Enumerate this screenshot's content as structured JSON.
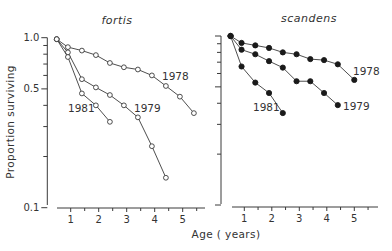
{
  "chart_data": [
    {
      "type": "line",
      "title": "fortis",
      "xlabel": "Age ( years)",
      "ylabel": "Proportion surviving",
      "yscale": "log",
      "ylim": [
        0.1,
        1.0
      ],
      "xlim": [
        0.5,
        5.5
      ],
      "yticks": [
        {
          "value": 1.0,
          "label": "1.0"
        },
        {
          "value": 0.5,
          "label": "0.5"
        },
        {
          "value": 0.1,
          "label": "0.1"
        }
      ],
      "yminor_ticks": [
        0.9,
        0.8,
        0.7,
        0.6,
        0.4,
        0.3,
        0.2
      ],
      "xticks": [
        1,
        2,
        3,
        4,
        5
      ],
      "xminor_ticks": [
        1.5,
        2.5,
        3.5,
        4.5,
        5.5
      ],
      "marker": "open-circle",
      "grid": false,
      "series": [
        {
          "name": "1978",
          "x": [
            0.5,
            0.9,
            1.4,
            1.9,
            2.4,
            2.9,
            3.4,
            3.9,
            4.4,
            4.9,
            5.4
          ],
          "values": [
            0.98,
            0.88,
            0.84,
            0.79,
            0.71,
            0.67,
            0.65,
            0.6,
            0.52,
            0.45,
            0.36
          ],
          "label_pos": [
            162,
            80
          ]
        },
        {
          "name": "1979",
          "x": [
            0.5,
            0.9,
            1.4,
            1.9,
            2.4,
            2.9,
            3.4,
            3.9,
            4.4
          ],
          "values": [
            0.98,
            0.82,
            0.57,
            0.51,
            0.46,
            0.4,
            0.34,
            0.23,
            0.15
          ],
          "label_pos": [
            134,
            112
          ]
        },
        {
          "name": "1981",
          "x": [
            0.5,
            0.9,
            1.4,
            1.9,
            2.4
          ],
          "values": [
            0.98,
            0.77,
            0.47,
            0.4,
            0.32
          ],
          "label_pos": [
            68,
            112
          ]
        }
      ]
    },
    {
      "type": "line",
      "title": "scandens",
      "xlabel": "Age ( years)",
      "ylabel": "",
      "yscale": "log",
      "ylim": [
        0.1,
        1.0
      ],
      "xlim": [
        0.5,
        5.5
      ],
      "yticks": [
        {
          "value": 1.0,
          "label": ""
        },
        {
          "value": 0.5,
          "label": ""
        },
        {
          "value": 0.1,
          "label": ""
        }
      ],
      "yminor_ticks": [
        0.9,
        0.8,
        0.7,
        0.6,
        0.4,
        0.3,
        0.2
      ],
      "xticks": [
        1,
        2,
        3,
        4,
        5
      ],
      "xminor_ticks": [
        1.5,
        2.5,
        3.5,
        4.5,
        5.5
      ],
      "marker": "filled-circle",
      "grid": false,
      "series": [
        {
          "name": "1978",
          "x": [
            0.5,
            0.9,
            1.4,
            1.9,
            2.4,
            2.9,
            3.4,
            3.9,
            4.4,
            5.0
          ],
          "values": [
            1.0,
            0.91,
            0.88,
            0.85,
            0.8,
            0.78,
            0.73,
            0.72,
            0.68,
            0.55
          ],
          "label_pos": [
            353,
            75
          ]
        },
        {
          "name": "1979",
          "x": [
            0.5,
            0.9,
            1.4,
            1.9,
            2.4,
            2.9,
            3.4,
            3.9,
            4.4
          ],
          "values": [
            1.0,
            0.83,
            0.78,
            0.71,
            0.65,
            0.54,
            0.54,
            0.46,
            0.39
          ],
          "label_pos": [
            343,
            110
          ]
        },
        {
          "name": "1981",
          "x": [
            0.5,
            0.9,
            1.4,
            1.9,
            2.4
          ],
          "values": [
            1.0,
            0.66,
            0.53,
            0.46,
            0.35
          ],
          "label_pos": [
            253,
            111
          ]
        }
      ]
    }
  ],
  "figure": {
    "ylabel": "Proportion surviving",
    "xlabel": "Age ( years)",
    "panels": [
      {
        "title": "fortis",
        "title_x": 117,
        "title_y": 24
      },
      {
        "title": "scandens",
        "title_x": 309,
        "title_y": 22
      }
    ]
  }
}
